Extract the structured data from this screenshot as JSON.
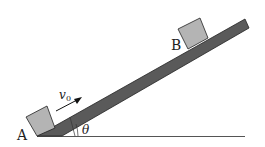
{
  "diagram": {
    "labels": {
      "point_a": "A",
      "point_b": "B",
      "velocity": "v",
      "velocity_sub": "0",
      "angle": "θ"
    },
    "colors": {
      "incline": "#5a5a5a",
      "block": "#b4b4b4",
      "outline": "#222222",
      "ground": "#555555"
    }
  }
}
